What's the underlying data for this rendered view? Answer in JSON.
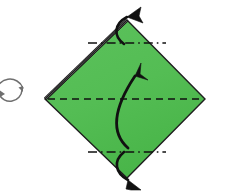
{
  "figure": {
    "kind": "origami-fold-diagram",
    "background_color": "#ffffff",
    "canvas": {
      "width": 228,
      "height": 195
    }
  },
  "colors": {
    "paper_fill": "#55bd55",
    "paper_fill_shade": "#4eb84e",
    "paper_edge": "#1e1e1e",
    "folded_edge_highlight": "#ffffff",
    "crease_line": "#111111",
    "arrow": "#111111",
    "rotate_symbol": "#6f6f6f"
  },
  "shapes": {
    "diamond": {
      "name": "square-sheet-rotated",
      "description": "Green square sheet rotated 45 degrees forming a diamond",
      "vertices": {
        "top": {
          "x": 127,
          "y": 20
        },
        "right": {
          "x": 205,
          "y": 99
        },
        "bottom": {
          "x": 127,
          "y": 178
        },
        "left": {
          "x": 45,
          "y": 99
        }
      },
      "points": "127,20 205,99 127,178 45,99",
      "stroke_width": 1.4
    },
    "folded_edge": {
      "name": "upper-left-folded-edge",
      "description": "Upper-left edge drawn as a doubled line indicating a previously folded layer",
      "from": {
        "x": 45,
        "y": 99
      },
      "to": {
        "x": 127,
        "y": 20
      },
      "outer_stroke_width": 3.2,
      "inner_stroke_width": 1.3
    }
  },
  "creases": [
    {
      "name": "valley-crease-center-horizontal",
      "style": "dashed",
      "label": "center horizontal fold line",
      "from": {
        "x": 48,
        "y": 99
      },
      "to": {
        "x": 202,
        "y": 99
      },
      "dasharray": "7 5",
      "stroke_width": 1.5
    },
    {
      "name": "mountain-crease-upper",
      "style": "dash-dot",
      "label": "upper dash-dot fold line",
      "from": {
        "x": 88,
        "y": 43
      },
      "to": {
        "x": 166,
        "y": 43
      },
      "dasharray": "9 4 1.6 4",
      "stroke_width": 1.6
    },
    {
      "name": "mountain-crease-lower",
      "style": "dash-dot",
      "label": "lower dash-dot fold line",
      "from": {
        "x": 88,
        "y": 152
      },
      "to": {
        "x": 166,
        "y": 152
      },
      "dasharray": "9 4 1.6 4",
      "stroke_width": 1.6
    }
  ],
  "arrows": [
    {
      "name": "fold-arrow-top",
      "description": "Curved arrow from the upper crease up past the top corner",
      "path": "M 124 44 C 113 36 114 24 127 17",
      "head": "M 127 17 L 141 7 L 139 16 L 143 23 Z",
      "stroke_width": 2.6,
      "direction": "up-right"
    },
    {
      "name": "fold-arrow-center",
      "description": "Large curved arrow through the centre pointing up",
      "path": "M 128 148 C 112 134 111 112 135 76",
      "head": "M 135 76 L 141 63 L 140 74 L 148 80 Z",
      "stroke_width": 2.8,
      "direction": "up"
    },
    {
      "name": "fold-arrow-bottom",
      "description": "Curved arrow from the lower crease down past the bottom corner",
      "path": "M 124 152 C 113 161 115 173 128 180",
      "head": "M 128 180 L 141 190 L 131 190 L 126 189 Z",
      "stroke_width": 2.6,
      "direction": "down-right"
    }
  ],
  "symbols": [
    {
      "name": "rotate-turn-over-symbol",
      "description": "Two curved arrows forming a circular turn-over / rotate indicator at the left margin",
      "center": {
        "x": 10,
        "y": 89
      },
      "radius": 14,
      "stroke_width": 1.5
    }
  ]
}
